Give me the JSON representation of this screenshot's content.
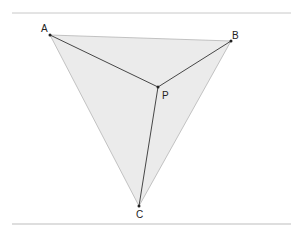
{
  "diagram": {
    "type": "triangle-with-interior-point",
    "points": {
      "A": {
        "label": "A",
        "x": 50,
        "y": 35
      },
      "B": {
        "label": "B",
        "x": 231,
        "y": 41
      },
      "C": {
        "label": "C",
        "x": 139,
        "y": 206
      },
      "P": {
        "label": "P",
        "x": 158,
        "y": 87
      }
    },
    "segments": [
      "AP",
      "BP",
      "CP"
    ],
    "triangle": "ABC",
    "colors": {
      "fill": "#ebebeb",
      "edge": "#b5b5b5",
      "segment": "#333333",
      "rule": "#c8c8c8"
    }
  }
}
